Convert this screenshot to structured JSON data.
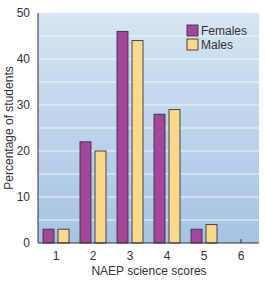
{
  "chart_data": {
    "type": "bar",
    "title": "",
    "xlabel": "NAEP science scores",
    "ylabel": "Percentage of students",
    "categories": [
      "1",
      "2",
      "3",
      "4",
      "5",
      "6"
    ],
    "series": [
      {
        "name": "Females",
        "values": [
          3,
          22,
          46,
          28,
          3,
          0
        ],
        "color": "#a4479b"
      },
      {
        "name": "Males",
        "values": [
          3,
          20,
          44,
          29,
          4,
          0
        ],
        "color": "#fbd98a"
      }
    ],
    "ylim": [
      0,
      50
    ],
    "yticks": [
      0,
      10,
      20,
      30,
      40,
      50
    ],
    "grid": true,
    "gridlines_minor_step": 5,
    "legend_position": "top-right",
    "background": "#c9dcee",
    "background_bottom": "#a9c6e6"
  }
}
